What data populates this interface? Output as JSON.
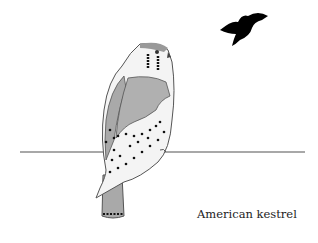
{
  "illustration": {
    "caption": "American kestrel",
    "subject": "kestrel-perched",
    "flying_silhouette": "bird-silhouette",
    "colors": {
      "outline": "#555555",
      "wing_gray": "#a9a9a9",
      "back_rust": "#b5b5b5",
      "breast_light": "#f2f2f2",
      "spot": "#111111",
      "wire": "#a0a0a0",
      "silhouette": "#000000"
    }
  }
}
